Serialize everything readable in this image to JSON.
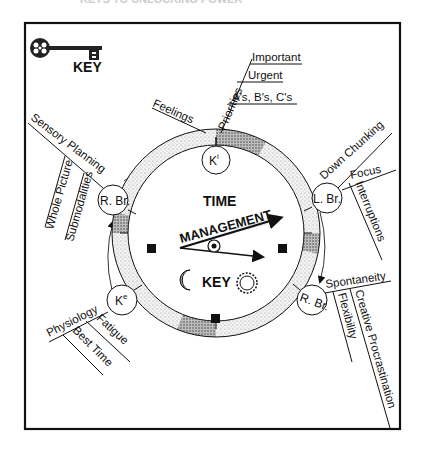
{
  "header_fragment": "KEYS TO UNLOCKING POWER",
  "key_logo": {
    "label": "KEY"
  },
  "clock": {
    "title_top": "TIME",
    "title_hand": "MANAGEMENT",
    "title_bottom": "KEY"
  },
  "nodes": {
    "ki": {
      "label": "K",
      "sup": "i"
    },
    "lbr": {
      "label": "L. Br."
    },
    "rbr_bottom": {
      "label": "R. Br."
    },
    "ke": {
      "label": "K",
      "sup": "e"
    },
    "rbr_left": {
      "label": "R. Br."
    }
  },
  "branches": {
    "ki": {
      "feelings": "Feelings",
      "priorities": "Priorities",
      "sub": [
        "Important",
        "Urgent",
        "A's, B's, C's"
      ]
    },
    "lbr": {
      "main": "Down Chunking",
      "focus": "Focus",
      "interruptions": "Interruptions"
    },
    "rbr_bottom": {
      "main": "Spontaneity",
      "creative": "Creative Procrastination",
      "flexibility": "Flexibility"
    },
    "ke": {
      "main": "Physiology",
      "fatigue": "Fatigue",
      "best_time": "Best Time"
    },
    "rbr_left": {
      "main": "Sensory Planning",
      "whole": "Whole Picture",
      "sub": "Submodalities"
    }
  }
}
